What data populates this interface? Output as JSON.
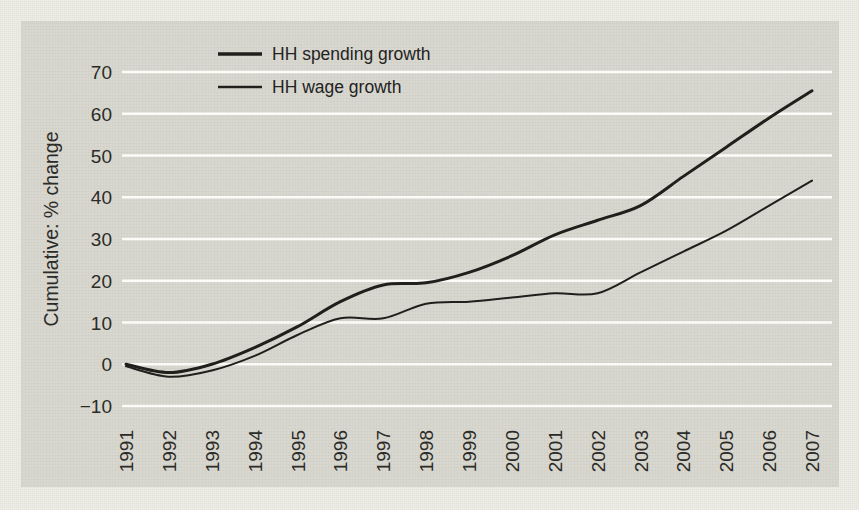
{
  "chart_data": {
    "type": "line",
    "title": "",
    "xlabel": "",
    "ylabel": "Cumulative: % change",
    "x": [
      1991,
      1992,
      1993,
      1994,
      1995,
      1996,
      1997,
      1998,
      1999,
      2000,
      2001,
      2002,
      2003,
      2004,
      2005,
      2006,
      2007
    ],
    "categories": [
      "1991",
      "1992",
      "1993",
      "1994",
      "1995",
      "1996",
      "1997",
      "1998",
      "1999",
      "2000",
      "2001",
      "2002",
      "2003",
      "2004",
      "2005",
      "2006",
      "2007"
    ],
    "xlim": [
      1991,
      2007
    ],
    "ylim": [
      -10,
      74
    ],
    "yticks": [
      -10,
      0,
      10,
      20,
      30,
      40,
      50,
      60,
      70
    ],
    "ytick_labels": [
      "−10",
      "0",
      "10",
      "20",
      "30",
      "40",
      "50",
      "60",
      "70"
    ],
    "grid": "horizontal",
    "legend_position": "top-center",
    "series": [
      {
        "name": "HH spending growth",
        "color": "#211f1c",
        "width": 3.0,
        "values": [
          0,
          -2,
          0,
          4,
          9,
          15,
          19,
          19.5,
          22,
          26,
          31,
          34.5,
          38,
          45,
          52,
          59,
          65.5
        ]
      },
      {
        "name": "HH wage growth",
        "color": "#211f1c",
        "width": 2.0,
        "values": [
          -0.5,
          -3,
          -1.5,
          2,
          7,
          11,
          11,
          14.5,
          15,
          16,
          17,
          17,
          22,
          27,
          32,
          38,
          44
        ]
      }
    ]
  },
  "colors": {
    "page_background": "#efeee7",
    "plot_background": "#d9d8d0",
    "gridline": "#fbfbf7",
    "ink": "#211f1c"
  }
}
